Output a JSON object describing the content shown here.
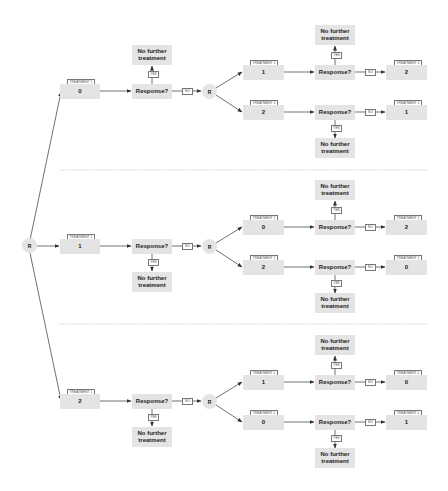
{
  "diagram": {
    "randomize_label": "R",
    "response_label": "Response?",
    "no_further_label": "No further treatment",
    "yes_label": "YES",
    "no_label": "NO",
    "sections": [
      {
        "stage1": {
          "tag": "TREATMENT 1",
          "value": "0"
        },
        "stage2": [
          {
            "tag": "TREATMENT 1",
            "value": "1",
            "final": {
              "tag": "TREATMENT 2",
              "value": "2"
            }
          },
          {
            "tag": "TREATMENT 2",
            "value": "2",
            "final": {
              "tag": "TREATMENT 1",
              "value": "1"
            }
          }
        ]
      },
      {
        "stage1": {
          "tag": "TREATMENT 1",
          "value": "1"
        },
        "stage2": [
          {
            "tag": "TREATMENT 2",
            "value": "0",
            "final": {
              "tag": "TREATMENT 2",
              "value": "2"
            }
          },
          {
            "tag": "TREATMENT 2",
            "value": "2",
            "final": {
              "tag": "TREATMENT 2",
              "value": "0"
            }
          }
        ]
      },
      {
        "stage1": {
          "tag": "TREATMENT 1",
          "value": "2"
        },
        "stage2": [
          {
            "tag": "TREATMENT 1",
            "value": "1",
            "final": {
              "tag": "TREATMENT 2",
              "value": "0"
            }
          },
          {
            "tag": "TREATMENT 2",
            "value": "0",
            "final": {
              "tag": "TREATMENT 1",
              "value": "1"
            }
          }
        ]
      }
    ],
    "colors": {
      "box": "#e4e4e4",
      "line": "#333333",
      "divider": "#bbbbbb"
    }
  }
}
